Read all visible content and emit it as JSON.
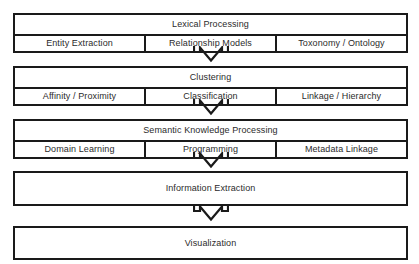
{
  "diagram": {
    "type": "vertical-flowchart",
    "orientation": "top-to-bottom",
    "connector": "hollow-down-arrow",
    "colors": {
      "background": "#ffffff",
      "border": "#1a1a1a",
      "text": "#2b2b2b",
      "box_fill": "#ffffff"
    },
    "stages": [
      {
        "id": "lexical-processing",
        "label": "Lexical Processing",
        "columns": [
          {
            "id": "entity-extraction",
            "label": "Entity Extraction"
          },
          {
            "id": "relationship-models",
            "label": "Relationship Models"
          },
          {
            "id": "toxonomy-ontology",
            "label": "Toxonomy / Ontology"
          }
        ]
      },
      {
        "id": "clustering",
        "label": "Clustering",
        "columns": [
          {
            "id": "affinity-proximity",
            "label": "Affinity / Proximity"
          },
          {
            "id": "classification",
            "label": "Classification"
          },
          {
            "id": "linkage-hierarchy",
            "label": "Linkage / Hierarchy"
          }
        ]
      },
      {
        "id": "semantic-knowledge-processing",
        "label": "Semantic Knowledge Processing",
        "columns": [
          {
            "id": "domain-learning",
            "label": "Domain Learning"
          },
          {
            "id": "programming",
            "label": "Programming"
          },
          {
            "id": "metadata-linkage",
            "label": "Metadata Linkage"
          }
        ]
      },
      {
        "id": "information-extraction",
        "label": "Information Extraction",
        "columns": []
      },
      {
        "id": "visualization",
        "label": "Visualization",
        "columns": []
      }
    ],
    "arrows": [
      {
        "id": "arrow-lexical-to-clustering",
        "from": "lexical-processing",
        "to": "clustering",
        "glyph": "down-arrow-icon"
      },
      {
        "id": "arrow-clustering-to-semantic",
        "from": "clustering",
        "to": "semantic-knowledge-processing",
        "glyph": "down-arrow-icon"
      },
      {
        "id": "arrow-semantic-to-information",
        "from": "semantic-knowledge-processing",
        "to": "information-extraction",
        "glyph": "down-arrow-icon"
      },
      {
        "id": "arrow-information-to-visualization",
        "from": "information-extraction",
        "to": "visualization",
        "glyph": "down-arrow-icon"
      }
    ]
  }
}
